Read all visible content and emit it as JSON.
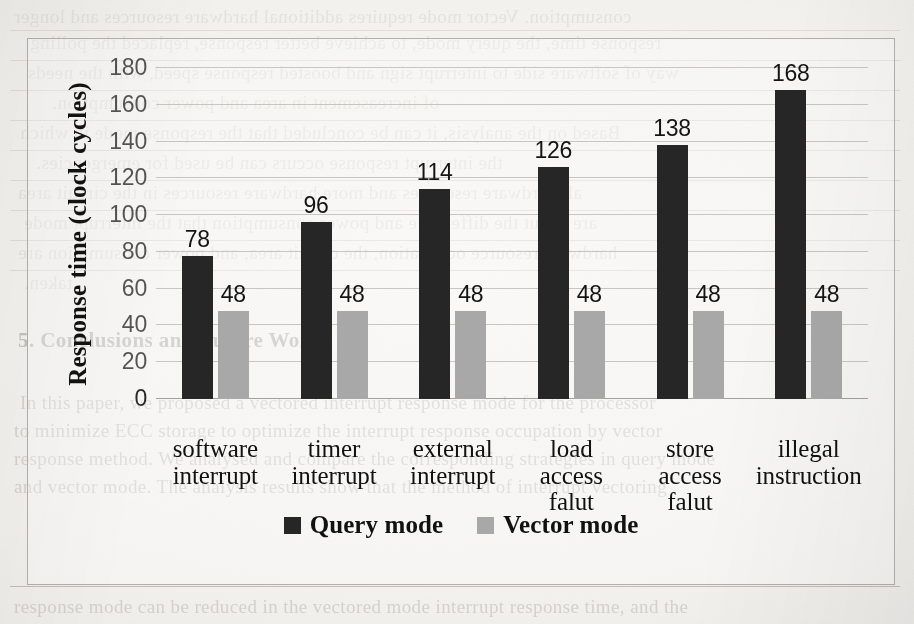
{
  "chart_data": {
    "type": "bar",
    "title": "",
    "xlabel": "",
    "ylabel": "Response time  (clock cycles)",
    "ylim": [
      0,
      180
    ],
    "ytick_step": 20,
    "yticks": [
      180,
      160,
      140,
      120,
      100,
      80,
      60,
      40,
      20,
      0
    ],
    "grid": true,
    "legend_position": "bottom",
    "categories": [
      "software\ninterrupt",
      "timer\ninterrupt",
      "external\ninterrupt",
      "load\naccess\nfalut",
      "store\naccess\nfalut",
      "illegal\ninstruction"
    ],
    "category_lines": [
      [
        "software",
        "interrupt"
      ],
      [
        "timer",
        "interrupt"
      ],
      [
        "external",
        "interrupt"
      ],
      [
        "load",
        "access",
        "falut"
      ],
      [
        "store",
        "access",
        "falut"
      ],
      [
        "illegal",
        "instruction"
      ]
    ],
    "series": [
      {
        "name": "Query mode",
        "color": "#262626",
        "values": [
          78,
          96,
          114,
          126,
          138,
          168
        ]
      },
      {
        "name": "Vector mode",
        "color": "#a8a8a8",
        "values": [
          48,
          48,
          48,
          48,
          48,
          48
        ]
      }
    ]
  },
  "legend": {
    "items": [
      {
        "label": "Query mode",
        "color": "#262626"
      },
      {
        "label": "Vector mode",
        "color": "#a8a8a8"
      }
    ]
  },
  "page_background": {
    "description": "faint bleed-through text from the reverse side of a scanned book page",
    "lines_top": [
      "consumption. Vector mode requires additional hardware resources and longer",
      "response time, the query mode, to achieve better response, replaced the polling",
      "way of software side to interrupt sign and boosted response speed, with the needs",
      "of increasement in area and power consumption.",
      "Based on the analysis, it can be concluded that the response mode in which",
      "the interrupt response occurs can be used for emergencies.",
      "all hardware resources and more hardware resources in the circuit area",
      "are about the difference and power consumption that the interrupt mode",
      "hardware resource occupation, the circuit area, and power consumption are",
      "taken."
    ],
    "heading_bottom": "5. Conclusions and Future Work",
    "lines_bottom": [
      "In this paper, we proposed a vectored interrupt response mode for the processor",
      "to minimize ECC storage to optimize the interrupt response occupation by vector",
      "response method. We analysed and compare the corresponding strategies in query mode",
      "and vector mode. The analysis results show that the method of interrupt vectoring",
      "response mode can be reduced in the vectored mode interrupt response time, and the"
    ]
  }
}
